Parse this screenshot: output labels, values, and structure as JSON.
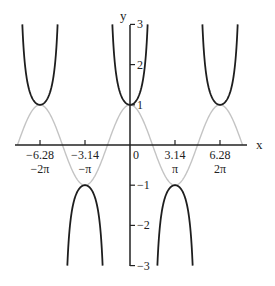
{
  "chart_data": {
    "type": "line",
    "title": "",
    "xlabel": "x",
    "ylabel": "y",
    "xlim": [
      -8.1,
      8.1
    ],
    "ylim": [
      -3,
      3
    ],
    "grid": false,
    "legend": null,
    "x_ticks": [
      {
        "value": -6.28,
        "label": "−6.28",
        "sublabel": "−2π"
      },
      {
        "value": -3.14,
        "label": "−3.14",
        "sublabel": "−π"
      },
      {
        "value": 0,
        "label": "0",
        "sublabel": ""
      },
      {
        "value": 3.14,
        "label": "3.14",
        "sublabel": "π"
      },
      {
        "value": 6.28,
        "label": "6.28",
        "sublabel": "2π"
      }
    ],
    "y_ticks": [
      {
        "value": 3,
        "label": "3"
      },
      {
        "value": 2,
        "label": "2"
      },
      {
        "value": 1,
        "label": "1"
      },
      {
        "value": -1,
        "label": "−1"
      },
      {
        "value": -2,
        "label": "−2"
      },
      {
        "value": -3,
        "label": "−3"
      }
    ],
    "series": [
      {
        "name": "y = cos x",
        "function": "cos",
        "color": "#c4c4c4",
        "domain": [
          -7.85,
          7.85
        ]
      },
      {
        "name": "y = sec x",
        "function": "sec",
        "color": "#1e1e1e",
        "domain": [
          -7.85,
          7.85
        ],
        "clip_abs": 3
      }
    ]
  },
  "layout": {
    "origin_px": [
      130,
      145
    ],
    "x_px_per_unit": 14.33,
    "y_px_per_unit": 40.2,
    "x_axis_px": [
      15,
      247
    ],
    "y_axis_px": [
      25,
      266
    ]
  }
}
